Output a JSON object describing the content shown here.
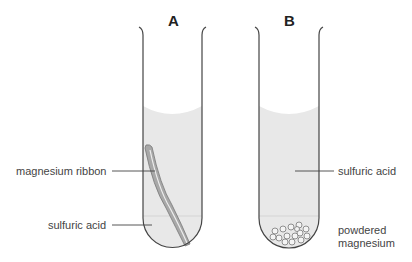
{
  "tubes": [
    {
      "title": "A",
      "contents": "magnesium ribbon in sulfuric acid"
    },
    {
      "title": "B",
      "contents": "powdered magnesium in sulfuric acid"
    }
  ],
  "labels": {
    "magnesium_ribbon": "magnesium ribbon",
    "sulfuric_acid_a": "sulfuric acid",
    "sulfuric_acid_b": "sulfuric acid",
    "powdered_line1": "powdered",
    "powdered_line2": "magnesium"
  },
  "colors": {
    "liquid": "#e6e6e6",
    "outline": "#444444",
    "ribbon": "#a8a8a8"
  }
}
